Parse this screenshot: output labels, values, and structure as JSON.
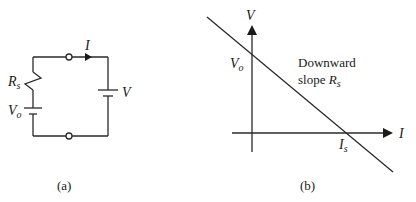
{
  "panel_a": {
    "caption": "(a)",
    "current_label": "I",
    "battery_label": "V",
    "resistor_label_main": "R",
    "resistor_label_sub": "s",
    "source_label_main": "V",
    "source_label_sub": "o"
  },
  "panel_b": {
    "caption": "(b)",
    "y_axis_label": "V",
    "x_axis_label": "I",
    "intercept_v_main": "V",
    "intercept_v_sub": "o",
    "intercept_i_main": "I",
    "intercept_i_sub": "s",
    "annotation_line1": "Downward",
    "annotation_line2_prefix": "slope ",
    "annotation_line2_main": "R",
    "annotation_line2_sub": "s"
  }
}
